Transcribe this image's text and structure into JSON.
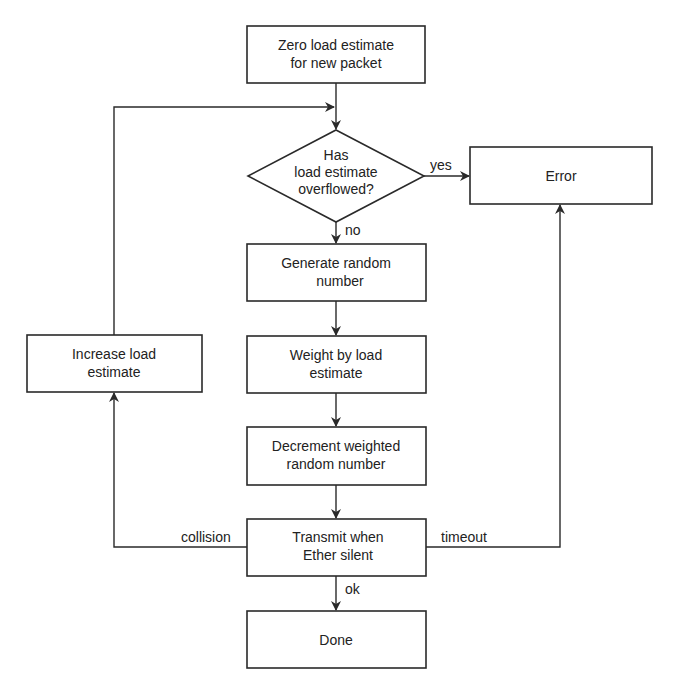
{
  "diagram": {
    "type": "flowchart",
    "nodes": {
      "zero": {
        "shape": "box",
        "lines": [
          "Zero load estimate",
          "for new packet"
        ]
      },
      "overflow": {
        "shape": "diamond",
        "lines": [
          "Has",
          "load estimate",
          "overflowed?"
        ]
      },
      "error": {
        "shape": "box",
        "lines": [
          "Error"
        ]
      },
      "generate": {
        "shape": "box",
        "lines": [
          "Generate random",
          "number"
        ]
      },
      "weight": {
        "shape": "box",
        "lines": [
          "Weight by load",
          "estimate"
        ]
      },
      "decrement": {
        "shape": "box",
        "lines": [
          "Decrement weighted",
          "random number"
        ]
      },
      "transmit": {
        "shape": "box",
        "lines": [
          "Transmit when",
          "Ether silent"
        ]
      },
      "done": {
        "shape": "box",
        "lines": [
          "Done"
        ]
      },
      "increase": {
        "shape": "box",
        "lines": [
          "Increase load",
          "estimate"
        ]
      }
    },
    "edges": [
      {
        "from": "zero",
        "to": "overflow",
        "label": ""
      },
      {
        "from": "overflow",
        "to": "error",
        "label": "yes"
      },
      {
        "from": "overflow",
        "to": "generate",
        "label": "no"
      },
      {
        "from": "generate",
        "to": "weight",
        "label": ""
      },
      {
        "from": "weight",
        "to": "decrement",
        "label": ""
      },
      {
        "from": "decrement",
        "to": "transmit",
        "label": ""
      },
      {
        "from": "transmit",
        "to": "done",
        "label": "ok"
      },
      {
        "from": "transmit",
        "to": "increase",
        "label": "collision"
      },
      {
        "from": "transmit",
        "to": "error",
        "label": "timeout"
      },
      {
        "from": "increase",
        "to": "overflow",
        "label": ""
      }
    ],
    "edge_labels": {
      "yes": "yes",
      "no": "no",
      "ok": "ok",
      "collision": "collision",
      "timeout": "timeout"
    },
    "colors": {
      "stroke": "#2a2a2a",
      "text": "#222222",
      "background": "#ffffff"
    }
  }
}
